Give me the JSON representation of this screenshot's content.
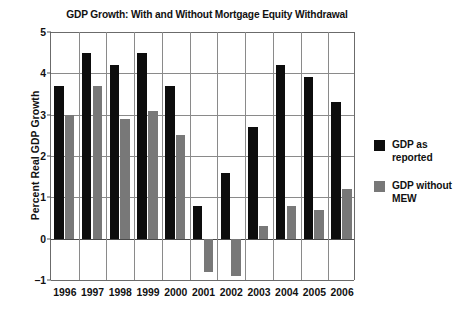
{
  "chart_data": {
    "type": "bar",
    "title": "GDP Growth: With and Without Mortgage Equity Withdrawal",
    "xlabel": "",
    "ylabel": "Percent Real GDP Growth",
    "categories": [
      "1996",
      "1997",
      "1998",
      "1999",
      "2000",
      "2001",
      "2002",
      "2003",
      "2004",
      "2005",
      "2006"
    ],
    "series": [
      {
        "name": "GDP as reported",
        "color": "#0d0d0d",
        "values": [
          3.7,
          4.5,
          4.2,
          4.5,
          3.7,
          0.8,
          1.6,
          2.7,
          4.2,
          3.9,
          3.3
        ]
      },
      {
        "name": "GDP without MEW",
        "color": "#787878",
        "values": [
          3.0,
          3.7,
          2.9,
          3.1,
          2.5,
          -0.8,
          -0.9,
          0.3,
          0.8,
          0.7,
          1.2
        ]
      }
    ],
    "ylim": [
      -1,
      5
    ],
    "yticks": [
      5,
      4,
      3,
      2,
      1,
      0,
      -1
    ],
    "ytick_labels": [
      "5",
      "4",
      "3",
      "2",
      "1",
      "0",
      "−1"
    ],
    "grid": true,
    "legend_position": "right",
    "legend": [
      {
        "label_line1": "GDP as",
        "label_line2": "reported",
        "color": "#0d0d0d"
      },
      {
        "label_line1": "GDP without",
        "label_line2": "MEW",
        "color": "#787878"
      }
    ]
  }
}
